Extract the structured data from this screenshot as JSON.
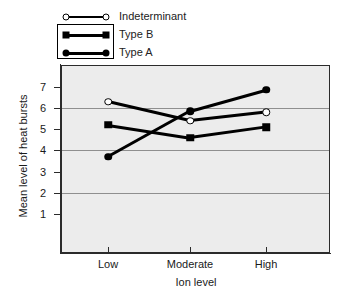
{
  "chart_data": {
    "type": "line",
    "title": "",
    "xlabel": "Ion level",
    "ylabel": "Mean level of heat bursts",
    "categories": [
      "Low",
      "Moderate",
      "High"
    ],
    "ylim": [
      0,
      7.6
    ],
    "yticks": [
      1,
      2,
      3,
      4,
      5,
      6,
      7
    ],
    "ytick_labels": [
      "1",
      "2",
      "3",
      "4",
      "5",
      "6",
      "7"
    ],
    "gridlines_at": [
      2,
      4,
      6
    ],
    "grid": true,
    "legend_position": "top",
    "series": [
      {
        "name": "Indeterminant",
        "marker": "circle-open",
        "values": [
          6.3,
          5.4,
          5.8
        ]
      },
      {
        "name": "Type B",
        "marker": "square-filled",
        "values": [
          5.2,
          4.6,
          5.1
        ]
      },
      {
        "name": "Type A",
        "marker": "circle-filled",
        "values": [
          3.7,
          5.85,
          6.85
        ]
      }
    ],
    "colors": {
      "line": "#000000",
      "plot_background": "#ececec",
      "gridline": "#8f8f8f",
      "axis": "#2b2b2b",
      "text": "#1a1a1a"
    }
  },
  "legend": {
    "entries": [
      {
        "label": "Indeterminant",
        "marker": "circle-open"
      },
      {
        "label": "Type B",
        "marker": "square-filled"
      },
      {
        "label": "Type A",
        "marker": "circle-filled"
      }
    ]
  },
  "axes": {
    "y_title": "Mean level of heat bursts",
    "x_title": "Ion level",
    "x_categories": [
      "Low",
      "Moderate",
      "High"
    ],
    "y_tick_labels": [
      "7",
      "6",
      "5",
      "4",
      "3",
      "2",
      "1"
    ]
  }
}
